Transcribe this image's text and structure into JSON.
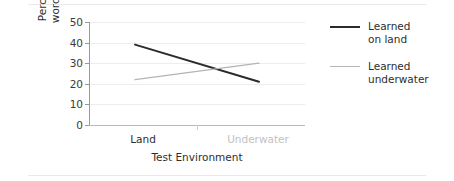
{
  "chart_data": {
    "type": "line",
    "title": "",
    "xlabel": "Test Environment",
    "ylabel": "Percentage of\nwords recalled",
    "categories": [
      "Land",
      "Underwater"
    ],
    "x": [
      0,
      1
    ],
    "ylim": [
      0,
      50
    ],
    "yticks": [
      0,
      10,
      20,
      30,
      40,
      50
    ],
    "ytick_labels": [
      "0",
      "10",
      "20",
      "30",
      "40",
      "50"
    ],
    "grid": true,
    "legend_position": "right",
    "series": [
      {
        "name": "Learned\non land",
        "values": [
          39,
          21
        ],
        "color": "#2b2b2b",
        "linewidth": 2.0
      },
      {
        "name": "Learned\nunderwater",
        "values": [
          22,
          30
        ],
        "color": "#b4b4b4",
        "linewidth": 1.3
      }
    ]
  },
  "axes": {
    "y_title": "Percentage of\nwords recalled",
    "x_title": "Test Environment",
    "y_ticks": [
      {
        "label": "50",
        "value": 50
      },
      {
        "label": "40",
        "value": 40
      },
      {
        "label": "30",
        "value": 30
      },
      {
        "label": "20",
        "value": 20
      },
      {
        "label": "10",
        "value": 10
      },
      {
        "label": "0",
        "value": 0
      }
    ],
    "x_categories": [
      {
        "label": "Land",
        "tone": "dark"
      },
      {
        "label": "Underwater",
        "tone": "light"
      }
    ]
  },
  "legend": {
    "items": [
      {
        "label": "Learned\non land",
        "color": "#2b2b2b"
      },
      {
        "label": "Learned\nunderwater",
        "color": "#b4b4b4"
      }
    ]
  },
  "colors": {
    "learned_on_land": "#2b2b2b",
    "learned_underwater": "#b4b4b4",
    "grid": "#ededed",
    "axis": "#9a9a9a",
    "text": "#2e2e2e",
    "muted_text": "#c2c2c2",
    "background": "#ffffff"
  }
}
